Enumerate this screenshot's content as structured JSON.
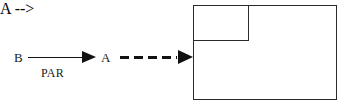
{
  "figure": {
    "background_color": "#ffffff",
    "ink_color": "#121212"
  },
  "nodes": {
    "source_label": "B",
    "target_label": "A",
    "outer_box_label": "B",
    "inner_box_label": "A"
  },
  "edges": {
    "relation_label": "PAR",
    "solid_arrow_style": "solid",
    "dashed_arrow_style": "dashed"
  },
  "chart_data": {
    "type": "diagram",
    "nodes": [
      {
        "id": "left-B",
        "label": "B",
        "shape": "text",
        "x": 18,
        "y": 57
      },
      {
        "id": "left-A",
        "label": "A",
        "shape": "text",
        "x": 105,
        "y": 57
      },
      {
        "id": "outer-B",
        "label": "B",
        "shape": "rectangle",
        "x": 193,
        "y": 5,
        "width": 144,
        "height": 95
      },
      {
        "id": "inner-A",
        "label": "A",
        "shape": "rectangle",
        "x": 193,
        "y": 5,
        "width": 56,
        "height": 36
      }
    ],
    "edges": [
      {
        "from": "left-B",
        "to": "left-A",
        "label": "PAR",
        "style": "solid",
        "arrowhead": "filled-triangle"
      },
      {
        "from": "left-A",
        "to": "outer-B",
        "label": "",
        "style": "dashed",
        "arrowhead": "filled-triangle"
      }
    ],
    "annotations": [
      "A is nested inside B"
    ]
  }
}
